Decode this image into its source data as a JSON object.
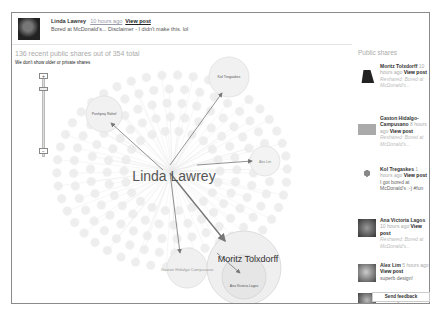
{
  "post": {
    "author": "Linda Lawrey",
    "time": "10 hours ago",
    "view_post": "View post",
    "text": "Bored at McDonald's... Disclaimer - I didn't make this. lol"
  },
  "ripples": {
    "summary": "136 recent public shares out of 354 total",
    "note": "We don't show older or private shares",
    "zoom_in": "+",
    "zoom_out": "−",
    "legend_note": "Circles within circles represent a resharing sequence, so large circles indicate heavy resharing."
  },
  "graph": {
    "center": "Linda Lawrey",
    "nodes": [
      {
        "label": "Kol Tregaskes",
        "big": false
      },
      {
        "label": "Pushpraj Rohel",
        "big": false
      },
      {
        "label": "Alex Lim",
        "big": false
      },
      {
        "label": "Gaston Hidalgo Campusano",
        "big": false
      },
      {
        "label": "Moritz Tolxdorff",
        "big": true
      },
      {
        "label": "Ana Victoria Lagos",
        "big": false
      }
    ]
  },
  "sidebar": {
    "title": "Public shares",
    "shares": [
      {
        "name": "Moritz Tolxdorff",
        "time": "10 hours ago",
        "view": "View post",
        "sub": "Reshared: Bored at McDonald's..."
      },
      {
        "name": "Gaston Hidalgo-Campusano",
        "time": "8 hours ago",
        "view": "View post",
        "sub": "Reshared: Bored at McDonald's..."
      },
      {
        "name": "Kol Tregaskes",
        "time": "1 hours ago",
        "view": "View post",
        "msg": "I got bored at McDonald's :-) #fun"
      },
      {
        "name": "Ana Victoria Lagos",
        "time": "10 hours ago",
        "view": "View post",
        "sub": "Reshared: Bored at McDonald's..."
      },
      {
        "name": "Alex Lim",
        "time": "5 hours ago",
        "view": "View post",
        "msg": "superb design!"
      },
      {
        "name": "Pushpraj Rohel",
        "time": "4 hours ago",
        "view": "View post"
      }
    ]
  },
  "feedback": {
    "label": "Send feedback"
  }
}
